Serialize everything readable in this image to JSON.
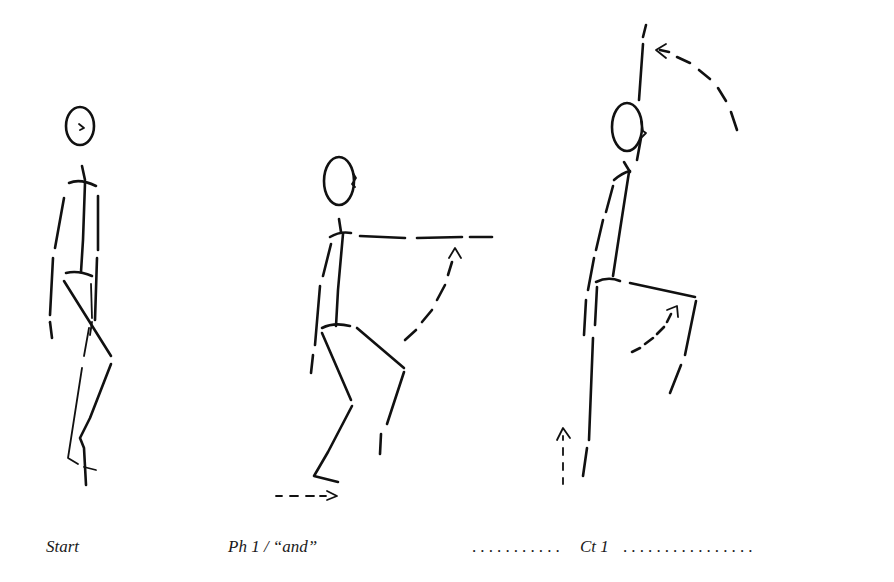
{
  "diagram": {
    "type": "movement-sequence-stick-figures",
    "stroke_color": "#111111",
    "background": "#ffffff",
    "figures": [
      {
        "id": "start",
        "pose": "standing upright, arms at sides"
      },
      {
        "id": "phase-1",
        "pose": "knees bent, right arm raised forward to horizontal",
        "motion_arrows": [
          "arm-raise-arc",
          "foot-slide-forward"
        ]
      },
      {
        "id": "count-1",
        "pose": "standing on one leg, knee raised, arm raised overhead",
        "motion_arrows": [
          "arm-overhead-arc",
          "knee-raise-arc",
          "rise-up"
        ]
      }
    ],
    "labels": [
      {
        "text": "Start"
      },
      {
        "text": "Ph 1 / “and”"
      },
      {
        "text": "Ct 1"
      }
    ],
    "dots_before_ct": "...........",
    "dots_after_ct": "................"
  }
}
